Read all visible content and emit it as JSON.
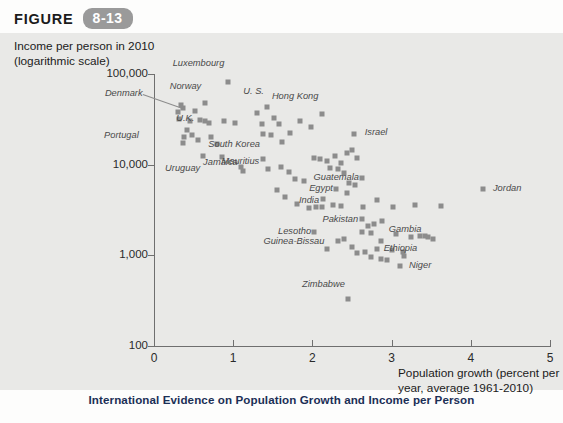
{
  "figure": {
    "word": "FIGURE",
    "number": "8-13"
  },
  "caption": {
    "title": "International Evidence on Population Growth and Income per Person",
    "subtitle": ""
  },
  "chart_data": {
    "type": "scatter",
    "title": "International Evidence on Population Growth and Income per Person",
    "xlabel": "Population growth (percent per year, average 1961-2010)",
    "ylabel": "Income per person in 2010 (logarithmic scale)",
    "ylabel_line1": "Income per person in 2010",
    "ylabel_line2": "(logarithmic scale)",
    "xlabel_line1": "Population growth (percent per",
    "xlabel_line2": "year, average 1961-2010)",
    "yscale": "log",
    "xlim": [
      0,
      5
    ],
    "ylim": [
      100,
      100000
    ],
    "xticks": [
      "0",
      "1",
      "2",
      "3",
      "4",
      "5"
    ],
    "xtick_values": [
      0,
      1,
      2,
      3,
      4,
      5
    ],
    "yticks": [
      "100",
      "1,000",
      "10,000",
      "100,000"
    ],
    "ytick_values": [
      100,
      1000,
      10000,
      100000
    ],
    "grid": false,
    "legend": "none",
    "marker_color": "#8c8c8c",
    "background_color": "#e9e9e7",
    "points": [
      {
        "label": "Luxembourg",
        "x": 0.93,
        "y": 82000,
        "lx": 0.74,
        "ly": 128000
      },
      {
        "label": "Norway",
        "x": 0.64,
        "y": 48000,
        "lx": 0.46,
        "ly": 72000
      },
      {
        "label": "Denmark",
        "x": 0.37,
        "y": 42000,
        "lx": -0.62,
        "ly": 60000,
        "leader": true
      },
      {
        "label": "U. S.",
        "x": 1.43,
        "y": 43000,
        "lx": 1.3,
        "ly": 64000
      },
      {
        "label": "Hong Kong",
        "x": 2.12,
        "y": 36000,
        "lx": 1.9,
        "ly": 56000
      },
      {
        "label": "U.K.",
        "x": 0.32,
        "y": 32000,
        "lx": 0.28,
        "ly": 32000
      },
      {
        "label": "Portugal",
        "x": 0.38,
        "y": 20000,
        "lx": -0.63,
        "ly": 20500
      },
      {
        "label": "South Korea",
        "x": 1.38,
        "y": 22000,
        "lx": 1.18,
        "ly": 16500
      },
      {
        "label": "Israel",
        "x": 2.52,
        "y": 22000,
        "lx": 2.66,
        "ly": 22500
      },
      {
        "label": "Uruguay",
        "x": 0.62,
        "y": 12500,
        "lx": 0.31,
        "ly": 9000
      },
      {
        "label": "Jamaica",
        "x": 1.1,
        "y": 9500,
        "lx": 0.92,
        "ly": 10500
      },
      {
        "label": "Mauritius",
        "x": 1.37,
        "y": 11500,
        "lx": 1.3,
        "ly": 10600
      },
      {
        "label": "Guatemala",
        "x": 2.62,
        "y": 7200,
        "lx": 2.5,
        "ly": 7100
      },
      {
        "label": "Egypt",
        "x": 2.3,
        "y": 5400,
        "lx": 2.11,
        "ly": 5400
      },
      {
        "label": "India",
        "x": 2.12,
        "y": 3400,
        "lx": 1.94,
        "ly": 4000
      },
      {
        "label": "Pakistan",
        "x": 2.62,
        "y": 2500,
        "lx": 2.46,
        "ly": 2450
      },
      {
        "label": "Jordan",
        "x": 4.15,
        "y": 5400,
        "lx": 4.28,
        "ly": 5400
      },
      {
        "label": "Lesotho",
        "x": 2.02,
        "y": 1800,
        "lx": 1.67,
        "ly": 1820
      },
      {
        "label": "Guinea-Bissau",
        "x": 2.19,
        "y": 1180,
        "lx": 1.67,
        "ly": 1420
      },
      {
        "label": "Ethiopia",
        "x": 2.82,
        "y": 1160,
        "lx": 2.9,
        "ly": 1170
      },
      {
        "label": "Gambia",
        "x": 3.42,
        "y": 1650,
        "lx": 3.27,
        "ly": 1900
      },
      {
        "label": "Niger",
        "x": 3.1,
        "y": 760,
        "lx": 3.22,
        "ly": 760
      },
      {
        "label": "Zimbabwe",
        "x": 2.45,
        "y": 330,
        "lx": 2.22,
        "ly": 470
      }
    ],
    "unlabeled_points": [
      {
        "x": 0.3,
        "y": 38000
      },
      {
        "x": 0.34,
        "y": 46000
      },
      {
        "x": 0.45,
        "y": 30000
      },
      {
        "x": 0.52,
        "y": 39000
      },
      {
        "x": 0.58,
        "y": 31000
      },
      {
        "x": 0.64,
        "y": 30500
      },
      {
        "x": 0.7,
        "y": 29000
      },
      {
        "x": 0.42,
        "y": 24000
      },
      {
        "x": 0.48,
        "y": 21000
      },
      {
        "x": 0.55,
        "y": 18500
      },
      {
        "x": 0.36,
        "y": 17500
      },
      {
        "x": 0.72,
        "y": 20000
      },
      {
        "x": 0.8,
        "y": 17000
      },
      {
        "x": 0.88,
        "y": 30000
      },
      {
        "x": 1.02,
        "y": 29000
      },
      {
        "x": 1.3,
        "y": 37000
      },
      {
        "x": 1.52,
        "y": 33000
      },
      {
        "x": 1.58,
        "y": 28000
      },
      {
        "x": 1.36,
        "y": 28000
      },
      {
        "x": 1.48,
        "y": 21000
      },
      {
        "x": 1.72,
        "y": 22500
      },
      {
        "x": 1.84,
        "y": 30000
      },
      {
        "x": 1.62,
        "y": 18000
      },
      {
        "x": 1.98,
        "y": 26000
      },
      {
        "x": 0.86,
        "y": 12000
      },
      {
        "x": 1.12,
        "y": 8600
      },
      {
        "x": 1.44,
        "y": 9000
      },
      {
        "x": 1.6,
        "y": 9500
      },
      {
        "x": 1.7,
        "y": 8200
      },
      {
        "x": 1.78,
        "y": 7000
      },
      {
        "x": 1.9,
        "y": 6600
      },
      {
        "x": 1.55,
        "y": 5200
      },
      {
        "x": 1.66,
        "y": 4400
      },
      {
        "x": 1.8,
        "y": 3700
      },
      {
        "x": 2.02,
        "y": 11800
      },
      {
        "x": 2.1,
        "y": 11500
      },
      {
        "x": 2.18,
        "y": 11000
      },
      {
        "x": 2.28,
        "y": 12500
      },
      {
        "x": 2.36,
        "y": 10500
      },
      {
        "x": 2.44,
        "y": 13500
      },
      {
        "x": 2.5,
        "y": 14500
      },
      {
        "x": 2.56,
        "y": 11800
      },
      {
        "x": 2.22,
        "y": 9200
      },
      {
        "x": 2.32,
        "y": 9000
      },
      {
        "x": 2.4,
        "y": 8000
      },
      {
        "x": 2.46,
        "y": 6200
      },
      {
        "x": 2.54,
        "y": 6000
      },
      {
        "x": 2.14,
        "y": 4200
      },
      {
        "x": 2.26,
        "y": 3600
      },
      {
        "x": 2.36,
        "y": 3500
      },
      {
        "x": 2.44,
        "y": 4900
      },
      {
        "x": 2.04,
        "y": 3400
      },
      {
        "x": 1.96,
        "y": 3300
      },
      {
        "x": 2.64,
        "y": 3400
      },
      {
        "x": 2.82,
        "y": 4100
      },
      {
        "x": 3.02,
        "y": 3400
      },
      {
        "x": 3.3,
        "y": 3600
      },
      {
        "x": 3.62,
        "y": 3500
      },
      {
        "x": 2.7,
        "y": 2100
      },
      {
        "x": 2.78,
        "y": 2200
      },
      {
        "x": 2.88,
        "y": 2400
      },
      {
        "x": 2.62,
        "y": 1800
      },
      {
        "x": 2.74,
        "y": 1750
      },
      {
        "x": 3.06,
        "y": 1700
      },
      {
        "x": 3.24,
        "y": 1600
      },
      {
        "x": 3.36,
        "y": 1620
      },
      {
        "x": 3.46,
        "y": 1580
      },
      {
        "x": 2.4,
        "y": 1520
      },
      {
        "x": 2.5,
        "y": 1250
      },
      {
        "x": 2.56,
        "y": 1050
      },
      {
        "x": 2.66,
        "y": 1080
      },
      {
        "x": 2.74,
        "y": 960
      },
      {
        "x": 2.86,
        "y": 900
      },
      {
        "x": 2.94,
        "y": 880
      },
      {
        "x": 3.0,
        "y": 1150
      },
      {
        "x": 3.14,
        "y": 1080
      },
      {
        "x": 3.16,
        "y": 980
      },
      {
        "x": 2.32,
        "y": 1450
      },
      {
        "x": 2.86,
        "y": 1450
      },
      {
        "x": 3.52,
        "y": 1500
      }
    ]
  }
}
